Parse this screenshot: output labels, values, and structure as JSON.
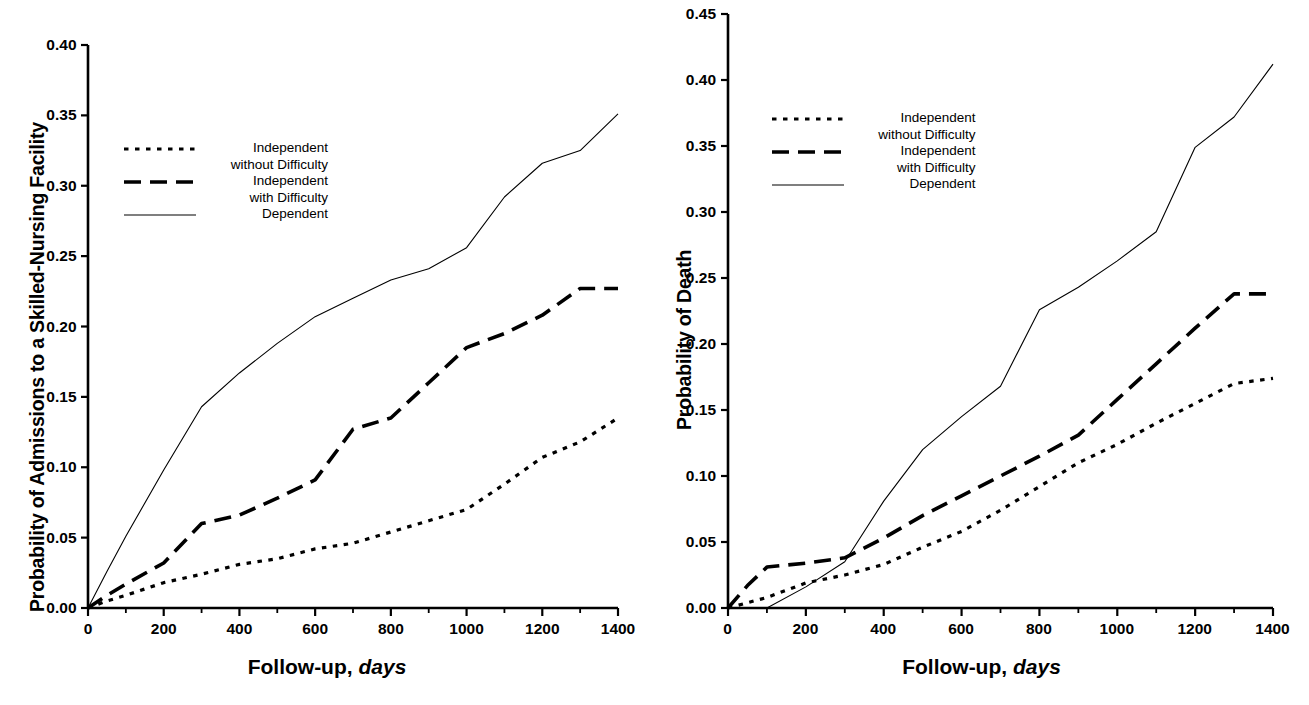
{
  "figure": {
    "panels": [
      {
        "id": "left",
        "ylabel": "Probability of Admissions to a Skilled-Nursing Facility",
        "xlabel_main": "Follow-up,",
        "xlabel_italic": "days",
        "yticks": [
          "0.00",
          "0.05",
          "0.10",
          "0.15",
          "0.20",
          "0.25",
          "0.30",
          "0.35",
          "0.40"
        ],
        "xticks": [
          "0",
          "200",
          "400",
          "600",
          "800",
          "1000",
          "1200",
          "1400"
        ],
        "legend": [
          {
            "label": "Independent",
            "sub": "without Difficulty",
            "style": "dotted"
          },
          {
            "label": "Independent",
            "sub": "with Difficulty",
            "style": "dashed"
          },
          {
            "label": "Dependent",
            "sub": "",
            "style": "solid"
          }
        ]
      },
      {
        "id": "right",
        "ylabel": "Probability of Death",
        "xlabel_main": "Follow-up,",
        "xlabel_italic": "days",
        "yticks": [
          "0.00",
          "0.05",
          "0.10",
          "0.15",
          "0.20",
          "0.25",
          "0.30",
          "0.35",
          "0.40",
          "0.45"
        ],
        "xticks": [
          "0",
          "200",
          "400",
          "600",
          "800",
          "1000",
          "1200",
          "1400"
        ],
        "legend": [
          {
            "label": "Independent",
            "sub": "without Difficulty",
            "style": "dotted"
          },
          {
            "label": "Independent",
            "sub": "with Difficulty",
            "style": "dashed"
          },
          {
            "label": "Dependent",
            "sub": "",
            "style": "solid"
          }
        ]
      }
    ]
  },
  "chart_data": [
    {
      "type": "line",
      "panel": "left",
      "title": "",
      "xlabel": "Follow-up, days",
      "ylabel": "Probability of Admissions to a Skilled-Nursing Facility",
      "xlim": [
        0,
        1400
      ],
      "ylim": [
        0,
        0.4
      ],
      "xticks": [
        0,
        200,
        400,
        600,
        800,
        1000,
        1200,
        1400
      ],
      "yticks": [
        0.0,
        0.05,
        0.1,
        0.15,
        0.2,
        0.25,
        0.3,
        0.35,
        0.4
      ],
      "xminor_interval": 100,
      "grid": false,
      "legend_position": "upper-left",
      "series": [
        {
          "name": "Independent without Difficulty",
          "style": "dotted",
          "x": [
            0,
            50,
            100,
            200,
            300,
            400,
            500,
            600,
            700,
            800,
            900,
            1000,
            1100,
            1200,
            1300,
            1400
          ],
          "y": [
            0.0,
            0.005,
            0.009,
            0.018,
            0.024,
            0.031,
            0.035,
            0.042,
            0.046,
            0.054,
            0.062,
            0.07,
            0.088,
            0.107,
            0.118,
            0.135
          ]
        },
        {
          "name": "Independent with Difficulty",
          "style": "dashed",
          "x": [
            0,
            50,
            100,
            200,
            300,
            400,
            500,
            600,
            700,
            800,
            900,
            1000,
            1100,
            1200,
            1300,
            1400
          ],
          "y": [
            0.0,
            0.009,
            0.017,
            0.032,
            0.06,
            0.066,
            0.078,
            0.091,
            0.127,
            0.135,
            0.16,
            0.185,
            0.195,
            0.208,
            0.227,
            0.227
          ]
        },
        {
          "name": "Dependent",
          "style": "solid",
          "x": [
            0,
            50,
            100,
            200,
            300,
            400,
            500,
            600,
            700,
            800,
            900,
            1000,
            1100,
            1200,
            1300,
            1400
          ],
          "y": [
            0.0,
            0.026,
            0.051,
            0.098,
            0.143,
            0.167,
            0.188,
            0.207,
            0.22,
            0.233,
            0.241,
            0.256,
            0.292,
            0.316,
            0.325,
            0.351
          ]
        }
      ]
    },
    {
      "type": "line",
      "panel": "right",
      "title": "",
      "xlabel": "Follow-up, days",
      "ylabel": "Probability of Death",
      "xlim": [
        0,
        1400
      ],
      "ylim": [
        0,
        0.45
      ],
      "xticks": [
        0,
        200,
        400,
        600,
        800,
        1000,
        1200,
        1400
      ],
      "yticks": [
        0.0,
        0.05,
        0.1,
        0.15,
        0.2,
        0.25,
        0.3,
        0.35,
        0.4,
        0.45
      ],
      "xminor_interval": 100,
      "grid": false,
      "legend_position": "upper-left",
      "series": [
        {
          "name": "Independent without Difficulty",
          "style": "dotted",
          "x": [
            0,
            50,
            100,
            200,
            300,
            400,
            500,
            600,
            700,
            800,
            900,
            1000,
            1100,
            1200,
            1300,
            1400
          ],
          "y": [
            0.0,
            0.004,
            0.008,
            0.019,
            0.025,
            0.033,
            0.046,
            0.058,
            0.074,
            0.092,
            0.11,
            0.124,
            0.14,
            0.155,
            0.17,
            0.174
          ]
        },
        {
          "name": "Independent with Difficulty",
          "style": "dashed",
          "x": [
            0,
            50,
            100,
            200,
            300,
            400,
            500,
            600,
            700,
            800,
            900,
            1000,
            1100,
            1200,
            1300,
            1400
          ],
          "y": [
            0.0,
            0.017,
            0.031,
            0.034,
            0.038,
            0.053,
            0.07,
            0.085,
            0.1,
            0.115,
            0.131,
            0.158,
            0.185,
            0.212,
            0.238,
            0.238
          ]
        },
        {
          "name": "Dependent",
          "style": "solid",
          "x": [
            0,
            50,
            100,
            200,
            300,
            400,
            500,
            600,
            700,
            800,
            900,
            1000,
            1100,
            1200,
            1300,
            1400
          ],
          "y": [
            0.0,
            0.0,
            0.0,
            0.016,
            0.035,
            0.081,
            0.12,
            0.145,
            0.168,
            0.226,
            0.243,
            0.263,
            0.285,
            0.349,
            0.372,
            0.412
          ]
        }
      ]
    }
  ]
}
